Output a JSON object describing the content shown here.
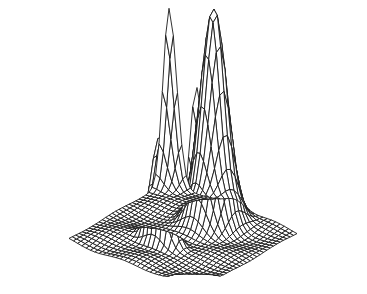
{
  "chart_data": {
    "type": "surface-wireframe",
    "title": "",
    "xlabel": "",
    "ylabel": "",
    "zlabel": "",
    "axes_visible": false,
    "grid_resolution": 30,
    "domain": {
      "x": [
        -1,
        1
      ],
      "y": [
        -1,
        1
      ]
    },
    "zlim": [
      0,
      1
    ],
    "colors": {
      "line": "#1a1a1a",
      "face": "#ffffff",
      "background": "#ffffff"
    },
    "peaks": [
      {
        "name": "back-center-peak",
        "x": 0.55,
        "y": -0.05,
        "height": 1.0,
        "sigma_x": 0.18,
        "sigma_y": 0.16
      },
      {
        "name": "front-center-peak",
        "x": -0.3,
        "y": 0.1,
        "height": 0.55,
        "sigma_x": 0.08,
        "sigma_y": 0.14
      },
      {
        "name": "left-corner-spike",
        "x": -1.0,
        "y": -1.0,
        "height": 0.95,
        "sigma_x": 0.14,
        "sigma_y": 0.14
      },
      {
        "name": "right-corner-spike",
        "x": 1.0,
        "y": 1.0,
        "height": 0.8,
        "sigma_x": 0.12,
        "sigma_y": 0.12
      }
    ],
    "projection": {
      "origin": [
        183,
        236
      ],
      "x_axis": [
        0.5,
        -0.29
      ],
      "y_axis": [
        -0.64,
        -0.26
      ],
      "scale": 100,
      "z_scale": 215
    }
  }
}
